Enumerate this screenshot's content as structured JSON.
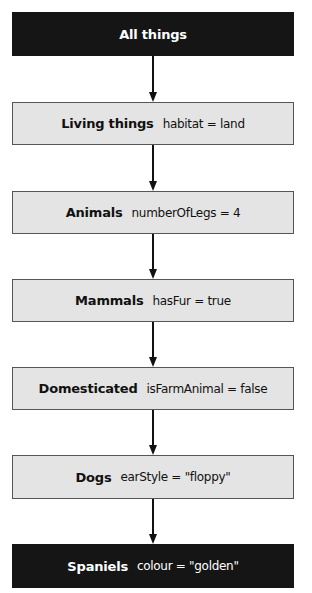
{
  "diagram": {
    "type": "inheritance-hierarchy",
    "nodes": [
      {
        "name": "All things",
        "attribute": "",
        "style": "dark"
      },
      {
        "name": "Living things",
        "attribute": "habitat = land",
        "style": "light"
      },
      {
        "name": "Animals",
        "attribute": "numberOfLegs = 4",
        "style": "light"
      },
      {
        "name": "Mammals",
        "attribute": "hasFur = true",
        "style": "light"
      },
      {
        "name": "Domesticated",
        "attribute": "isFarmAnimal = false",
        "style": "light"
      },
      {
        "name": "Dogs",
        "attribute": "earStyle = \"floppy\"",
        "style": "light"
      },
      {
        "name": "Spaniels",
        "attribute": "colour = \"golden\"",
        "style": "dark"
      }
    ],
    "edges": [
      {
        "from": "All things",
        "to": "Living things"
      },
      {
        "from": "Living things",
        "to": "Animals"
      },
      {
        "from": "Animals",
        "to": "Mammals"
      },
      {
        "from": "Mammals",
        "to": "Domesticated"
      },
      {
        "from": "Domesticated",
        "to": "Dogs"
      },
      {
        "from": "Dogs",
        "to": "Spaniels"
      }
    ],
    "colors": {
      "dark_fill": "#151515",
      "light_fill": "#e4e4e4",
      "border": "#555555",
      "arrow": "#111111"
    }
  }
}
